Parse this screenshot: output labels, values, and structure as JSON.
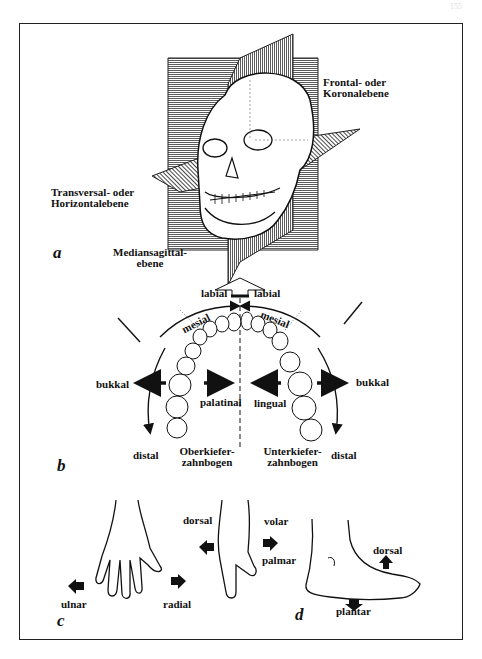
{
  "figure": {
    "page_number": "155",
    "panels": [
      {
        "letter": "a",
        "subject": "skull-with-anatomical-planes",
        "labels": {
          "frontal_line1": "Frontal- oder",
          "frontal_line2": "Koronalebene",
          "transversal_line1": "Transversal- oder",
          "transversal_line2": "Horizontalebene",
          "median_line1": "Mediansagittal-",
          "median_line2": "ebene"
        }
      },
      {
        "letter": "b",
        "subject": "dental-arches",
        "labels": {
          "labial_left": "labial",
          "labial_right": "labial",
          "mesial_left": "mesial",
          "mesial_right": "mesial",
          "bukkal_left": "bukkal",
          "bukkal_right": "bukkal",
          "palatinal": "palatinal",
          "lingual": "lingual",
          "distal_left": "distal",
          "distal_right": "distal",
          "upper_arch_line1": "Oberkiefer-",
          "upper_arch_line2": "zahnbogen",
          "lower_arch_line1": "Unterkiefer-",
          "lower_arch_line2": "zahnbogen"
        }
      },
      {
        "letter": "c",
        "subject": "hand-directions",
        "labels": {
          "ulnar": "ulnar",
          "radial": "radial",
          "dorsal": "dorsal",
          "volar": "volar",
          "palmar": "palmar"
        }
      },
      {
        "letter": "d",
        "subject": "foot-directions",
        "labels": {
          "dorsal": "dorsal",
          "plantar": "plantar"
        }
      }
    ]
  }
}
